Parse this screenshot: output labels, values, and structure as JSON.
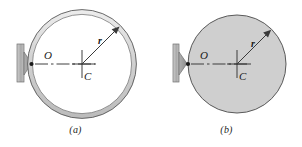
{
  "figure": {
    "background_color": "#ffffff",
    "ink_color": "#1a1a1a",
    "panels": [
      {
        "id": "a",
        "caption": "(a)",
        "body_type": "ring",
        "body_name": "hollow-ring",
        "fill_color": "#d8d8d8",
        "stroke_color": "#555555",
        "outer_radius_px": 52,
        "inner_radius_px": 47,
        "center": {
          "x": 82,
          "y": 64
        },
        "labels": {
          "pivot": "O",
          "center": "C",
          "radius": "r"
        },
        "support": {
          "name": "wall-bracket",
          "wall_color": "#b4b4b4",
          "gusset_color": "#9a9a9a",
          "pivot_dot_color": "#1a1a1a"
        },
        "centerline_style": "dash-dot",
        "radius_arrow_angle_deg": 45
      },
      {
        "id": "b",
        "caption": "(b)",
        "body_type": "disk",
        "body_name": "solid-disk",
        "fill_color": "#cfcfcf",
        "stroke_color": "#555555",
        "outer_radius_px": 49,
        "inner_radius_px": 0,
        "center": {
          "x": 86,
          "y": 64
        },
        "labels": {
          "pivot": "O",
          "center": "C",
          "radius": "r"
        },
        "support": {
          "name": "wall-bracket",
          "wall_color": "#b4b4b4",
          "gusset_color": "#9a9a9a",
          "pivot_dot_color": "#1a1a1a"
        },
        "centerline_style": "dash-dot",
        "radius_arrow_angle_deg": 45
      }
    ]
  }
}
